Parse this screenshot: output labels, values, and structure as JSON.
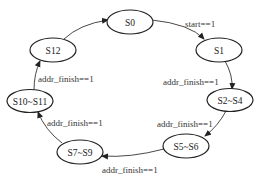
{
  "diagram": {
    "type": "state-machine",
    "states": [
      {
        "id": "S0",
        "label": "S0"
      },
      {
        "id": "S1",
        "label": "S1"
      },
      {
        "id": "S2_S4",
        "label": "S2~S4"
      },
      {
        "id": "S5_S6",
        "label": "S5~S6"
      },
      {
        "id": "S7_S9",
        "label": "S7~S9"
      },
      {
        "id": "S10_S11",
        "label": "S10~S11"
      },
      {
        "id": "S12",
        "label": "S12"
      }
    ],
    "transitions": [
      {
        "from": "S0",
        "to": "S1",
        "label": "start==1"
      },
      {
        "from": "S1",
        "to": "S2~S4",
        "label": "addr_finish==1"
      },
      {
        "from": "S2~S4",
        "to": "S5~S6",
        "label": "addr_finish==1"
      },
      {
        "from": "S5~S6",
        "to": "S7~S9",
        "label": "addr_finish==1"
      },
      {
        "from": "S7~S9",
        "to": "S10~S11",
        "label": "addr_finish==1"
      },
      {
        "from": "S10~S11",
        "to": "S12",
        "label": "addr_finish==1"
      },
      {
        "from": "S12",
        "to": "S0",
        "label": ""
      }
    ]
  }
}
